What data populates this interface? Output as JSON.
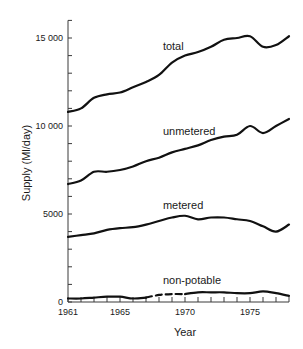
{
  "chart_data": {
    "type": "line",
    "title": "",
    "xlabel": "Year",
    "ylabel": "Supply (Ml/day)",
    "x": [
      1961,
      1962,
      1963,
      1964,
      1965,
      1966,
      1967,
      1968,
      1969,
      1970,
      1971,
      1972,
      1973,
      1974,
      1975,
      1976,
      1977,
      1978
    ],
    "xlim": [
      1961,
      1978
    ],
    "ylim": [
      0,
      16000
    ],
    "x_ticks": [
      {
        "value": 1961,
        "label": "1961"
      },
      {
        "value": 1965,
        "label": "1965"
      },
      {
        "value": 1970,
        "label": "1970"
      },
      {
        "value": 1975,
        "label": "1975"
      }
    ],
    "y_ticks": [
      {
        "value": 0,
        "label": "0"
      },
      {
        "value": 5000,
        "label": "5000"
      },
      {
        "value": 10000,
        "label": "10 000"
      },
      {
        "value": 15000,
        "label": "15 000"
      }
    ],
    "minor_y_step": 1000,
    "minor_x_step": 1,
    "grid": false,
    "legend": "inline labels",
    "series": [
      {
        "name": "total",
        "values": [
          10800,
          11000,
          11600,
          11800,
          11900,
          12200,
          12500,
          12900,
          13600,
          14000,
          14200,
          14500,
          14900,
          15000,
          15100,
          14500,
          14600,
          15100
        ],
        "label_pos": {
          "x": 1968.3,
          "y": 14300
        }
      },
      {
        "name": "unmetered",
        "values": [
          6700,
          6900,
          7400,
          7400,
          7500,
          7700,
          8000,
          8200,
          8500,
          8700,
          8900,
          9200,
          9400,
          9500,
          10000,
          9600,
          10000,
          10400
        ],
        "label_pos": {
          "x": 1968.3,
          "y": 9500
        }
      },
      {
        "name": "metered",
        "values": [
          3700,
          3800,
          3900,
          4100,
          4200,
          4250,
          4400,
          4600,
          4800,
          4900,
          4700,
          4800,
          4800,
          4700,
          4600,
          4300,
          4000,
          4400
        ],
        "label_pos": {
          "x": 1968.3,
          "y": 5300
        }
      },
      {
        "name": "non-potable",
        "values": [
          200,
          200,
          250,
          300,
          300,
          200,
          250,
          400,
          450,
          450,
          550,
          550,
          550,
          500,
          500,
          600,
          500,
          350
        ],
        "dashed_range": [
          1967,
          1970
        ],
        "label_pos": {
          "x": 1968.3,
          "y": 1000
        }
      }
    ]
  },
  "axis": {
    "xlabel": "Year",
    "ylabel": "Supply (Ml/day)"
  }
}
